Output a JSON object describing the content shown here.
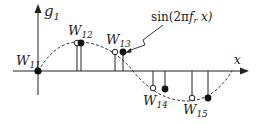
{
  "diagram": {
    "axes": {
      "y_label": "g",
      "y_label_sub": "1",
      "x_label": "x"
    },
    "curve_label": {
      "prefix": "sin(2π",
      "f": "f",
      "f_sub": "r",
      "suffix": " x)"
    },
    "points": [
      {
        "label": "W",
        "sub": "11"
      },
      {
        "label": "W",
        "sub": "12"
      },
      {
        "label": "W",
        "sub": "13"
      },
      {
        "label": "W",
        "sub": "14"
      },
      {
        "label": "W",
        "sub": "15"
      }
    ],
    "colors": {
      "stroke": "#222222",
      "background": "#ffffff"
    }
  }
}
